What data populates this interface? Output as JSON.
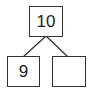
{
  "diagram": {
    "type": "number-bond",
    "whole": {
      "value": "10"
    },
    "parts": [
      {
        "value": "9"
      },
      {
        "value": ""
      }
    ],
    "line_color": "#333333"
  }
}
